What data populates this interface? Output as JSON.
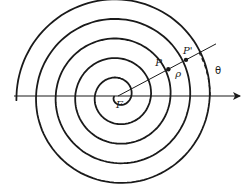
{
  "diagram": {
    "type": "archimedean-spiral",
    "colors": {
      "stroke": "#1a1a1a",
      "background": "#ffffff"
    },
    "center": {
      "x": 118,
      "y": 96
    },
    "spiral": {
      "growth_per_radian": 3.12,
      "start_angle_deg": 0,
      "end_angle_deg": 1795,
      "stroke_width": 1.8,
      "turns_visible": 5
    },
    "axis": {
      "x_start": 14,
      "x_end": 240,
      "y": 96,
      "arrowhead": true
    },
    "radius_line": {
      "angle_deg": 28,
      "length": 111
    },
    "points": [
      {
        "id": "P",
        "label": "P",
        "radius": 57,
        "label_dx": -13,
        "label_dy": -3
      },
      {
        "id": "P-prime",
        "label": "P'",
        "radius": 77,
        "label_dx": -3,
        "label_dy": -6
      }
    ],
    "labels": {
      "focus": "F",
      "point_p": "P",
      "point_p_prime": "P'",
      "rho": "ρ",
      "theta": "θ"
    },
    "angle_arc": {
      "radius": 92,
      "from_deg": 0,
      "to_deg": 28,
      "dashed": true
    }
  }
}
